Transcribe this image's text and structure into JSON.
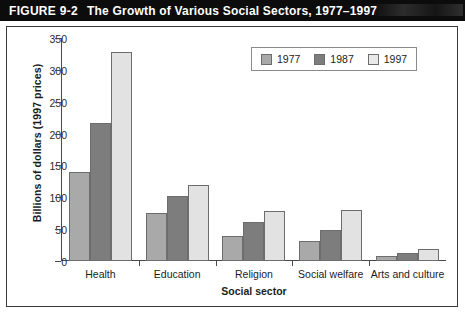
{
  "header": {
    "figure_number": "FIGURE 9-2",
    "title": "The Growth of Various Social Sectors, 1977–1997"
  },
  "chart_data": {
    "type": "bar",
    "title": "The Growth of Various Social Sectors, 1977–1997",
    "subtitle": "",
    "categories": [
      "Health",
      "Education",
      "Religion",
      "Social welfare",
      "Arts and culture"
    ],
    "series": [
      {
        "name": "1977",
        "color": "#a9a9a9",
        "values": [
          140,
          75,
          39,
          32,
          8
        ]
      },
      {
        "name": "1987",
        "color": "#7d7d7d",
        "values": [
          217,
          102,
          62,
          49,
          13
        ]
      },
      {
        "name": "1997",
        "color": "#e2e2e2",
        "values": [
          328,
          120,
          79,
          80,
          19
        ]
      }
    ],
    "xlabel": "Social sector",
    "ylabel": "Billions of dollars (1997 prices)",
    "ylim": [
      0,
      350
    ],
    "yticks": [
      0,
      50,
      100,
      150,
      200,
      250,
      300,
      350
    ],
    "ytick_labels": [
      "0",
      "50",
      "100",
      "150",
      "200",
      "250",
      "300",
      "350"
    ],
    "grid": false,
    "legend_position": "top-right",
    "legend_entries": [
      "1977",
      "1987",
      "1997"
    ]
  }
}
